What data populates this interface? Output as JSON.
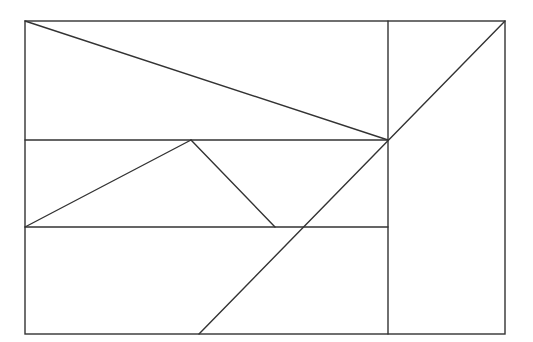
{
  "diagram": {
    "type": "geometric-figure",
    "stroke_color": "#333333",
    "background": "#ffffff",
    "outer_rect": {
      "x1": 25,
      "y1": 21,
      "x2": 505,
      "y2": 334
    },
    "segments": [
      {
        "name": "vertical-divider",
        "x1": 388,
        "y1": 21,
        "x2": 388,
        "y2": 334
      },
      {
        "name": "horizontal-line-upper",
        "x1": 25,
        "y1": 140,
        "x2": 388,
        "y2": 140
      },
      {
        "name": "horizontal-line-lower",
        "x1": 25,
        "y1": 227,
        "x2": 388,
        "y2": 227
      },
      {
        "name": "diagonal-top-left",
        "x1": 25,
        "y1": 21,
        "x2": 388,
        "y2": 140
      },
      {
        "name": "diagonal-long",
        "x1": 505,
        "y1": 21,
        "x2": 199,
        "y2": 334
      },
      {
        "name": "triangle-left-edge",
        "x1": 25,
        "y1": 227,
        "x2": 191,
        "y2": 140
      },
      {
        "name": "triangle-right-edge",
        "x1": 191,
        "y1": 140,
        "x2": 275,
        "y2": 227
      }
    ]
  }
}
